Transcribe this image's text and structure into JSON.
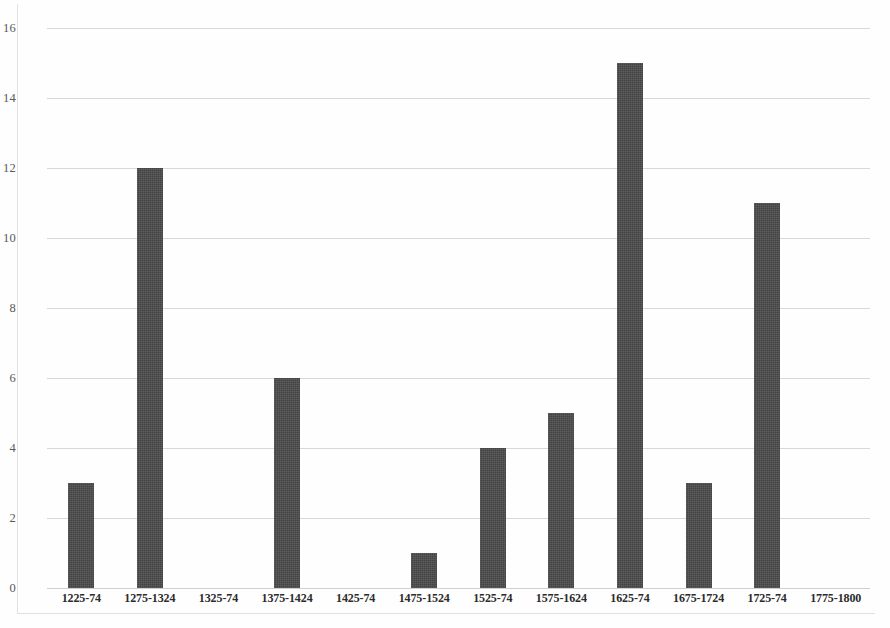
{
  "chart_data": {
    "type": "bar",
    "title": "",
    "subtitle": "",
    "xlabel": "",
    "ylabel": "",
    "categories": [
      "1225-74",
      "1275-1324",
      "1325-74",
      "1375-1424",
      "1425-74",
      "1475-1524",
      "1525-74",
      "1575-1624",
      "1625-74",
      "1675-1724",
      "1725-74",
      "1775-1800"
    ],
    "values": [
      3,
      12,
      0,
      6,
      0,
      1,
      4,
      5,
      15,
      3,
      11,
      0
    ],
    "ylim": [
      0,
      16
    ],
    "ytick_labels": [
      "0",
      "2",
      "4",
      "6",
      "8",
      "10",
      "12",
      "14",
      "16"
    ],
    "ytick_values": [
      0,
      2,
      4,
      6,
      8,
      10,
      12,
      14,
      16
    ],
    "grid": true,
    "grid_axis": "y",
    "legend": false,
    "legend_position": "none",
    "bar_color": "#4a4a4a",
    "gridline_color": "#d8d8d8",
    "axis_label_color": "#595959",
    "background_color": "#fefefe"
  }
}
